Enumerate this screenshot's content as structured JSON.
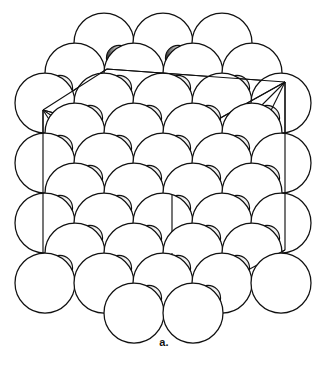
{
  "figure": {
    "caption": "a.",
    "title": "",
    "kind": "crystal-structure-packing-model",
    "colors": {
      "background": "#ffffff",
      "outline": "#111111",
      "small_sphere_shade": "#1a1a1a",
      "large_sphere_fill": "#ffffff",
      "cell_edge": "#111111"
    },
    "geometry": {
      "view_width": 328,
      "view_height": 373,
      "large_radius": 30,
      "small_radius": 12.5,
      "row_pitch_x": 59,
      "row_pitch_y": 45,
      "row_stagger_x": 29.5,
      "origin_x": 16,
      "origin_y": 40
    },
    "unit_cell": {
      "label": "cube wireframe unit cell",
      "front_face": [
        [
          43,
          110
        ],
        [
          172,
          145
        ],
        [
          172,
          311
        ],
        [
          43,
          281
        ]
      ],
      "top_face": [
        [
          43,
          110
        ],
        [
          107,
          69
        ],
        [
          285,
          82
        ],
        [
          172,
          145
        ]
      ],
      "right_face": [
        [
          172,
          145
        ],
        [
          285,
          82
        ],
        [
          285,
          250
        ],
        [
          172,
          311
        ]
      ],
      "vertical_edges": [
        {
          "from": [
            43,
            110
          ],
          "to": [
            43,
            281
          ]
        },
        {
          "from": [
            172,
            145
          ],
          "to": [
            172,
            311
          ]
        },
        {
          "from": [
            285,
            82
          ],
          "to": [
            285,
            250
          ]
        },
        {
          "from": [
            107,
            69
          ],
          "to": [
            107,
            69
          ]
        }
      ]
    },
    "tetrahedron": {
      "label": "inscribed tetrahedron face diagonals",
      "apex": [
        172,
        195
      ],
      "vertices": [
        [
          43,
          110
        ],
        [
          285,
          82
        ],
        [
          172,
          311
        ],
        [
          172,
          145
        ]
      ]
    },
    "large_spheres": [
      {
        "cx": 104,
        "cy": 43
      },
      {
        "cx": 163,
        "cy": 43
      },
      {
        "cx": 222,
        "cy": 43
      },
      {
        "cx": 75,
        "cy": 73
      },
      {
        "cx": 134,
        "cy": 73
      },
      {
        "cx": 193,
        "cy": 73
      },
      {
        "cx": 252,
        "cy": 73
      },
      {
        "cx": 45,
        "cy": 103
      },
      {
        "cx": 104,
        "cy": 103
      },
      {
        "cx": 163,
        "cy": 103
      },
      {
        "cx": 222,
        "cy": 103
      },
      {
        "cx": 281,
        "cy": 103
      },
      {
        "cx": 75,
        "cy": 133
      },
      {
        "cx": 134,
        "cy": 133
      },
      {
        "cx": 193,
        "cy": 133
      },
      {
        "cx": 252,
        "cy": 133
      },
      {
        "cx": 45,
        "cy": 163
      },
      {
        "cx": 104,
        "cy": 163
      },
      {
        "cx": 163,
        "cy": 163
      },
      {
        "cx": 222,
        "cy": 163
      },
      {
        "cx": 281,
        "cy": 163
      },
      {
        "cx": 75,
        "cy": 193
      },
      {
        "cx": 134,
        "cy": 193
      },
      {
        "cx": 193,
        "cy": 193
      },
      {
        "cx": 252,
        "cy": 193
      },
      {
        "cx": 45,
        "cy": 223
      },
      {
        "cx": 104,
        "cy": 223
      },
      {
        "cx": 163,
        "cy": 223
      },
      {
        "cx": 222,
        "cy": 223
      },
      {
        "cx": 281,
        "cy": 223
      },
      {
        "cx": 75,
        "cy": 253
      },
      {
        "cx": 134,
        "cy": 253
      },
      {
        "cx": 193,
        "cy": 253
      },
      {
        "cx": 252,
        "cy": 253
      },
      {
        "cx": 45,
        "cy": 283
      },
      {
        "cx": 104,
        "cy": 283
      },
      {
        "cx": 163,
        "cy": 283
      },
      {
        "cx": 222,
        "cy": 283
      },
      {
        "cx": 281,
        "cy": 283
      },
      {
        "cx": 134,
        "cy": 313
      },
      {
        "cx": 193,
        "cy": 313
      }
    ],
    "small_spheres": [
      {
        "cx": 119,
        "cy": 58
      },
      {
        "cx": 178,
        "cy": 58
      },
      {
        "cx": 60,
        "cy": 88
      },
      {
        "cx": 119,
        "cy": 88
      },
      {
        "cx": 178,
        "cy": 88
      },
      {
        "cx": 237,
        "cy": 88
      },
      {
        "cx": 90,
        "cy": 118
      },
      {
        "cx": 149,
        "cy": 118
      },
      {
        "cx": 208,
        "cy": 118
      },
      {
        "cx": 267,
        "cy": 118
      },
      {
        "cx": 60,
        "cy": 148
      },
      {
        "cx": 119,
        "cy": 148
      },
      {
        "cx": 178,
        "cy": 148
      },
      {
        "cx": 237,
        "cy": 148
      },
      {
        "cx": 90,
        "cy": 178
      },
      {
        "cx": 149,
        "cy": 178
      },
      {
        "cx": 208,
        "cy": 178
      },
      {
        "cx": 267,
        "cy": 178
      },
      {
        "cx": 60,
        "cy": 208
      },
      {
        "cx": 119,
        "cy": 208
      },
      {
        "cx": 178,
        "cy": 208
      },
      {
        "cx": 237,
        "cy": 208
      },
      {
        "cx": 90,
        "cy": 238
      },
      {
        "cx": 149,
        "cy": 238
      },
      {
        "cx": 208,
        "cy": 238
      },
      {
        "cx": 267,
        "cy": 238
      },
      {
        "cx": 60,
        "cy": 268
      },
      {
        "cx": 119,
        "cy": 268
      },
      {
        "cx": 178,
        "cy": 268
      },
      {
        "cx": 237,
        "cy": 268
      },
      {
        "cx": 149,
        "cy": 298
      },
      {
        "cx": 208,
        "cy": 298
      }
    ]
  }
}
